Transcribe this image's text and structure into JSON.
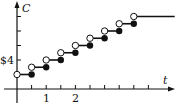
{
  "chart_data": {
    "type": "line",
    "subtype": "step",
    "title": "",
    "xlabel": "t",
    "ylabel": "C",
    "x_tick_labels": [
      {
        "value": 1,
        "label": "1"
      },
      {
        "value": 2,
        "label": "2"
      }
    ],
    "x_ticks": [
      0.5,
      1,
      1.5,
      2,
      2.5,
      3,
      3.5,
      4,
      4.5
    ],
    "y_tick_labels": [
      {
        "value": 4,
        "label": "$4"
      }
    ],
    "y_ticks": [
      4,
      6,
      8,
      10
    ],
    "xlim": [
      0,
      5.4
    ],
    "ylim": [
      0,
      12
    ],
    "grid": false,
    "segments": [
      {
        "x_start": 0.0,
        "x_end": 0.5,
        "y": 2,
        "start": "open",
        "end": "closed"
      },
      {
        "x_start": 0.5,
        "x_end": 1.0,
        "y": 3,
        "start": "open",
        "end": "closed"
      },
      {
        "x_start": 1.0,
        "x_end": 1.5,
        "y": 4,
        "start": "open",
        "end": "closed"
      },
      {
        "x_start": 1.5,
        "x_end": 2.0,
        "y": 5,
        "start": "open",
        "end": "closed"
      },
      {
        "x_start": 2.0,
        "x_end": 2.5,
        "y": 6,
        "start": "open",
        "end": "closed"
      },
      {
        "x_start": 2.5,
        "x_end": 3.0,
        "y": 7,
        "start": "open",
        "end": "closed"
      },
      {
        "x_start": 3.0,
        "x_end": 3.5,
        "y": 8,
        "start": "open",
        "end": "closed"
      },
      {
        "x_start": 3.5,
        "x_end": 4.0,
        "y": 9,
        "start": "open",
        "end": "closed"
      },
      {
        "x_start": 4.0,
        "x_end": 5.4,
        "y": 10,
        "start": "open",
        "end": "none"
      }
    ],
    "colors": {
      "line": "#111111",
      "open_fill": "#ffffff"
    }
  },
  "labels": {
    "y_axis": "C",
    "x_axis": "t",
    "y_tick_4": "$4",
    "x_tick_1": "1",
    "x_tick_2": "2"
  }
}
